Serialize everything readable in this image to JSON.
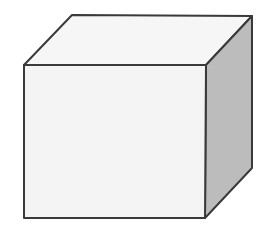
{
  "diagram": {
    "shape": "cube",
    "colors": {
      "front_face": "#f4f4f4",
      "top_face": "#f6f6f6",
      "side_face": "#bcbcbc",
      "edge": "#3a3a3a"
    },
    "vertices": {
      "front_top_left": [
        24,
        65
      ],
      "front_top_right": [
        206,
        65
      ],
      "front_bottom_left": [
        24,
        218
      ],
      "front_bottom_right": [
        205,
        218
      ],
      "back_top_left": [
        72,
        15
      ],
      "back_top_right": [
        252,
        16
      ],
      "back_bottom_right": [
        252,
        168
      ]
    }
  }
}
